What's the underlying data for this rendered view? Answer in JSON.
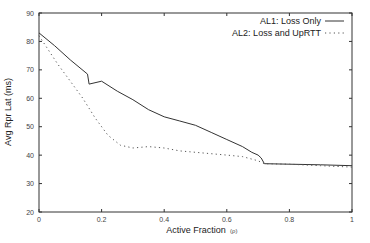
{
  "chart_data": {
    "type": "line",
    "title": "",
    "xlabel": "Active Fraction",
    "xlabel_symbol": "(ρ)",
    "ylabel": "Avg Rpr Lat (ms)",
    "xlim": [
      0,
      1
    ],
    "ylim": [
      20,
      90
    ],
    "xticks": [
      0,
      0.2,
      0.4,
      0.6,
      0.8,
      1
    ],
    "xtick_labels": [
      "0",
      "0.2",
      "0.4",
      "0.6",
      "0.8",
      "1"
    ],
    "yticks": [
      20,
      30,
      40,
      50,
      60,
      70,
      80,
      90
    ],
    "ytick_labels": [
      "20",
      "30",
      "40",
      "50",
      "60",
      "70",
      "80",
      "90"
    ],
    "grid": false,
    "legend_position": "top-right",
    "series": [
      {
        "name": "AL1: Loss Only",
        "style": "solid",
        "color": "#333333",
        "x": [
          0,
          0.05,
          0.1,
          0.155,
          0.16,
          0.2,
          0.25,
          0.3,
          0.35,
          0.4,
          0.45,
          0.5,
          0.55,
          0.6,
          0.65,
          0.68,
          0.7,
          0.71,
          0.72,
          0.8,
          0.9,
          1.0
        ],
        "y": [
          83,
          78.5,
          73.5,
          68.5,
          65,
          66,
          62.5,
          59.5,
          56,
          53.5,
          52,
          50.5,
          48,
          45.5,
          43,
          41,
          40,
          39,
          37,
          36.8,
          36.6,
          36.3
        ]
      },
      {
        "name": "AL2: Loss and UpRTT",
        "style": "dotted",
        "color": "#555555",
        "x": [
          0,
          0.03,
          0.06,
          0.1,
          0.14,
          0.18,
          0.22,
          0.26,
          0.3,
          0.35,
          0.4,
          0.45,
          0.5,
          0.55,
          0.6,
          0.65,
          0.7,
          0.72,
          0.8,
          0.9,
          1.0
        ],
        "y": [
          82,
          77,
          72,
          66,
          60,
          53,
          47,
          43.5,
          42.5,
          43,
          42.5,
          41.5,
          41,
          40.5,
          40,
          39.5,
          38,
          37,
          36.8,
          36.3,
          35.8
        ]
      }
    ]
  },
  "legend": {
    "items": [
      {
        "label": "AL1: Loss Only"
      },
      {
        "label": "AL2: Loss and UpRTT"
      }
    ]
  }
}
